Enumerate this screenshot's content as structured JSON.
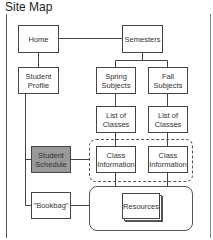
{
  "title": "Site Map",
  "nodes": {
    "home": "Home",
    "semesters": "Semesters",
    "student_profile": "Student Profile",
    "spring_subjects": "Spring Subjects",
    "fall_subjects": "Fall Subjects",
    "list_classes_spring": "List of Classes",
    "list_classes_fall": "List of Classes",
    "student_schedule": "Student Schedule",
    "class_info_spring": "Class Information",
    "class_info_fall": "Class Information",
    "bookbag": "\"Bookbag\"",
    "resources": "Resources"
  },
  "colors": {
    "highlight_fill": "#999999",
    "stroke": "#444444"
  }
}
